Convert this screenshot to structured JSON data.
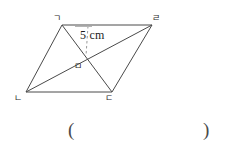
{
  "figure": {
    "type": "parallelogram-with-diagonals",
    "stroke_color": "#4a4a4a",
    "dash_color": "#9a9a9a",
    "background_color": "#ffffff",
    "vertices": [
      {
        "id": "a",
        "label": "ㄱ",
        "x": 62,
        "y": 25,
        "label_x": 53,
        "label_y": 14
      },
      {
        "id": "d",
        "label": "ㄹ",
        "x": 152,
        "y": 25,
        "label_x": 152,
        "label_y": 14
      },
      {
        "id": "c",
        "label": "ㄷ",
        "x": 112,
        "y": 92,
        "label_x": 105,
        "label_y": 94
      },
      {
        "id": "b",
        "label": "ㄴ",
        "x": 26,
        "y": 92,
        "label_x": 14,
        "label_y": 94
      }
    ],
    "intersection": {
      "id": "m",
      "label": "ㅁ",
      "x": 85,
      "y": 57,
      "label_x": 74,
      "label_y": 62
    },
    "measurement": {
      "text": "5 cm",
      "label_x": 80,
      "label_y": 29,
      "dash_from_x": 88,
      "dash_from_y": 26,
      "dash_to_x": 86,
      "dash_to_y": 56
    }
  },
  "answer_field": {
    "open_paren": "(",
    "close_paren": ")",
    "open_x": 68,
    "open_y": 120,
    "close_x": 203,
    "close_y": 120
  }
}
